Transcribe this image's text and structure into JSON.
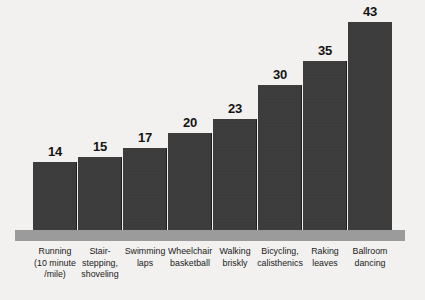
{
  "chart_data": {
    "type": "bar",
    "title": "",
    "xlabel": "",
    "ylabel": "",
    "ylim": [
      0,
      45
    ],
    "grid": false,
    "legend": "none",
    "orientation": "vertical",
    "categories": [
      "Running (10 minute /mile)",
      "Stair-stepping, shoveling",
      "Swimming laps",
      "Wheelchair basketball",
      "Walking briskly",
      "Bicycling, calisthenics",
      "Raking leaves",
      "Ballroom dancing"
    ],
    "category_lines": [
      [
        "Running",
        "(10 minute",
        "/mile)"
      ],
      [
        "Stair-",
        "stepping,",
        "shoveling"
      ],
      [
        "Swimming",
        "laps"
      ],
      [
        "Wheelchair",
        "basketball"
      ],
      [
        "Walking",
        "briskly"
      ],
      [
        "Bicycling,",
        "calisthenics"
      ],
      [
        "Raking",
        "leaves"
      ],
      [
        "Ballroom",
        "dancing"
      ]
    ],
    "values": [
      14,
      15,
      17,
      20,
      23,
      30,
      35,
      43
    ],
    "value_labels": [
      "14",
      "15",
      "17",
      "20",
      "23",
      "30",
      "35",
      "43"
    ],
    "colors": {
      "bar_fill": "#3b3b3b",
      "bar_separator": "#1e1e1e",
      "baseline_band": "#9d9d9d",
      "background": "#f2f1ef",
      "text": "#1a1a1a",
      "value_text": "#141414"
    }
  }
}
